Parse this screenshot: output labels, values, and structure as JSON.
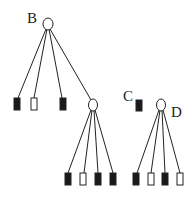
{
  "diagram": {
    "type": "pedigree",
    "labels": {
      "B": "B",
      "C": "C",
      "D": "D"
    },
    "colors": {
      "affected": "#1a1a1a",
      "unaffected": "#ffffff",
      "stroke": "#222222"
    },
    "nodes": [
      {
        "id": "B",
        "shape": "circle",
        "fill": "unaffected",
        "x": 48,
        "y": 24
      },
      {
        "id": "B1",
        "shape": "square",
        "fill": "affected",
        "x": 17,
        "y": 104
      },
      {
        "id": "B2",
        "shape": "square",
        "fill": "unaffected",
        "x": 34,
        "y": 104
      },
      {
        "id": "B3",
        "shape": "square",
        "fill": "affected",
        "x": 63,
        "y": 104
      },
      {
        "id": "B4",
        "shape": "circle",
        "fill": "unaffected",
        "x": 93,
        "y": 105
      },
      {
        "id": "B4_1",
        "shape": "square",
        "fill": "affected",
        "x": 68,
        "y": 179
      },
      {
        "id": "B4_2",
        "shape": "square",
        "fill": "unaffected",
        "x": 83,
        "y": 179
      },
      {
        "id": "B4_3",
        "shape": "square",
        "fill": "affected",
        "x": 98,
        "y": 179
      },
      {
        "id": "B4_4",
        "shape": "square",
        "fill": "affected",
        "x": 113,
        "y": 179
      },
      {
        "id": "C",
        "shape": "square",
        "fill": "affected",
        "x": 140,
        "y": 106
      },
      {
        "id": "D",
        "shape": "circle",
        "fill": "unaffected",
        "x": 161,
        "y": 105
      },
      {
        "id": "D1",
        "shape": "square",
        "fill": "affected",
        "x": 136,
        "y": 179
      },
      {
        "id": "D2",
        "shape": "square",
        "fill": "unaffected",
        "x": 151,
        "y": 179
      },
      {
        "id": "D3",
        "shape": "square",
        "fill": "affected",
        "x": 165,
        "y": 179
      },
      {
        "id": "D4",
        "shape": "square",
        "fill": "unaffected",
        "x": 180,
        "y": 179
      }
    ]
  }
}
